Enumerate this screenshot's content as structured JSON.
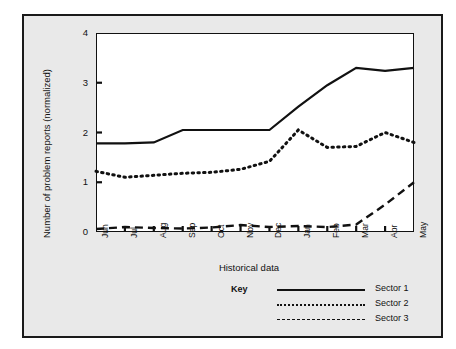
{
  "credit": "© 1987 Prentice-Hall, Inc. Reprinted with permission.",
  "legend": {
    "title": "Key",
    "entries": [
      {
        "label": "Sector 1",
        "style": "solid"
      },
      {
        "label": "Sector 2",
        "style": "dotted"
      },
      {
        "label": "Sector 3",
        "style": "dashed"
      }
    ]
  },
  "chart_data": {
    "type": "line",
    "title": "",
    "xlabel": "Historical data",
    "ylabel": "Number of problem reports (normalized)",
    "categories": [
      "Jun",
      "Jul",
      "Aug",
      "Sep",
      "Oct",
      "Nov",
      "Dec",
      "Jan",
      "Feb",
      "Mar",
      "Apr",
      "May"
    ],
    "x": [
      0,
      1,
      2,
      3,
      4,
      5,
      6,
      7,
      8,
      9,
      10,
      11
    ],
    "ylim": [
      0,
      4
    ],
    "yticks": [
      0,
      1,
      2,
      3,
      4
    ],
    "ytick_labels": [
      "0",
      "1",
      "2",
      "3",
      "4"
    ],
    "grid": false,
    "legend_position": "below-right",
    "series": [
      {
        "name": "Sector 1",
        "style": "solid",
        "values": [
          1.78,
          1.78,
          1.8,
          2.05,
          2.05,
          2.05,
          2.05,
          2.52,
          2.95,
          3.3,
          3.24,
          3.3
        ]
      },
      {
        "name": "Sector 2",
        "style": "dotted",
        "values": [
          1.22,
          1.1,
          1.14,
          1.18,
          1.2,
          1.26,
          1.42,
          2.05,
          1.7,
          1.72,
          2.0,
          1.8
        ]
      },
      {
        "name": "Sector 3",
        "style": "dashed",
        "values": [
          0.06,
          0.1,
          0.08,
          0.07,
          0.09,
          0.14,
          0.1,
          0.12,
          0.1,
          0.15,
          0.55,
          1.0
        ]
      }
    ]
  }
}
